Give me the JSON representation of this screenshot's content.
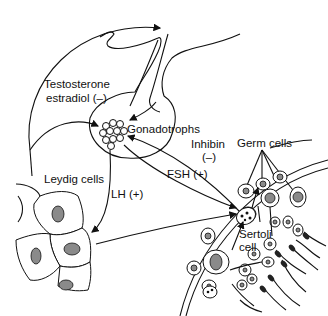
{
  "diagram": {
    "type": "hormonal-feedback-diagram",
    "labels": {
      "testosterone": "Testosterone",
      "estradiol": "estradiol (–)",
      "gonadotrophs": "Gonadotrophs",
      "inhibin": "Inhibin",
      "inhibin_sign": "(–)",
      "germ_cells": "Germ cells",
      "leydig_cells": "Leydig cells",
      "lh": "LH (+)",
      "fsh": "FSH (+)",
      "sertoli": "Sertoli",
      "sertoli_cell": "cell"
    },
    "colors": {
      "line": "#111111",
      "nucleus": "#8a8a8a",
      "background": "#ffffff"
    }
  }
}
